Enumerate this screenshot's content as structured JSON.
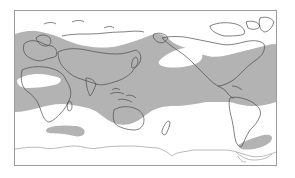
{
  "map": {
    "type": "world-distribution-map",
    "projection": "pacific-centered equirectangular",
    "colors": {
      "background": "#ffffff",
      "shaded_range": "#b3b3b3",
      "coastline": "#4a4a4a",
      "frame": "#9a9a9a",
      "antarctica": "#a8a8a8"
    },
    "legend": {
      "shaded_meaning": "distribution range"
    },
    "regions_visible": [
      "Europe",
      "Africa",
      "Asia",
      "Australia",
      "New Zealand",
      "North America",
      "Central America",
      "South America",
      "Pacific Ocean",
      "Atlantic Ocean",
      "Indian Ocean",
      "Antarctica"
    ]
  }
}
